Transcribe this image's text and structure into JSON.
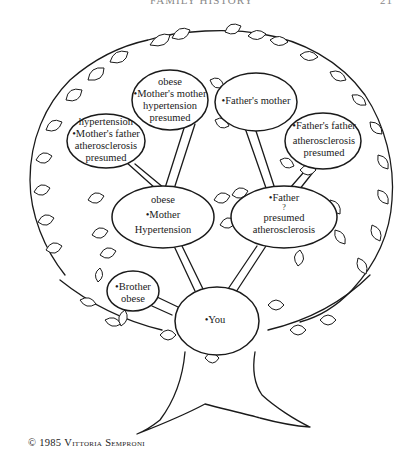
{
  "header": {
    "running_title": "FAMILY HISTORY",
    "page_number": "21"
  },
  "tree": {
    "nodes": {
      "mothers_mother": {
        "lines": [
          "obese",
          "•Mother's mother",
          "hypertension",
          "presumed"
        ]
      },
      "fathers_mother": {
        "lines": [
          "•Father's mother"
        ]
      },
      "mothers_father": {
        "lines": [
          "hypertension",
          "•Mother's father",
          "atherosclerosis",
          "presumed"
        ]
      },
      "fathers_father": {
        "lines": [
          "•Father's father",
          "atherosclerosis",
          "presumed"
        ]
      },
      "mother": {
        "lines": [
          "obese",
          "•Mother",
          "Hypertension"
        ]
      },
      "father": {
        "lines": [
          "•Father",
          "?",
          "presumed",
          "atherosclerosis"
        ]
      },
      "brother": {
        "lines": [
          "•Brother",
          "obese"
        ]
      },
      "you": {
        "lines": [
          "•You"
        ]
      }
    },
    "line_color": "#1a1a1a",
    "background_color": "#ffffff"
  },
  "credit": {
    "symbol": "©",
    "year": "1985",
    "artist": "Vittoria Semproni"
  }
}
